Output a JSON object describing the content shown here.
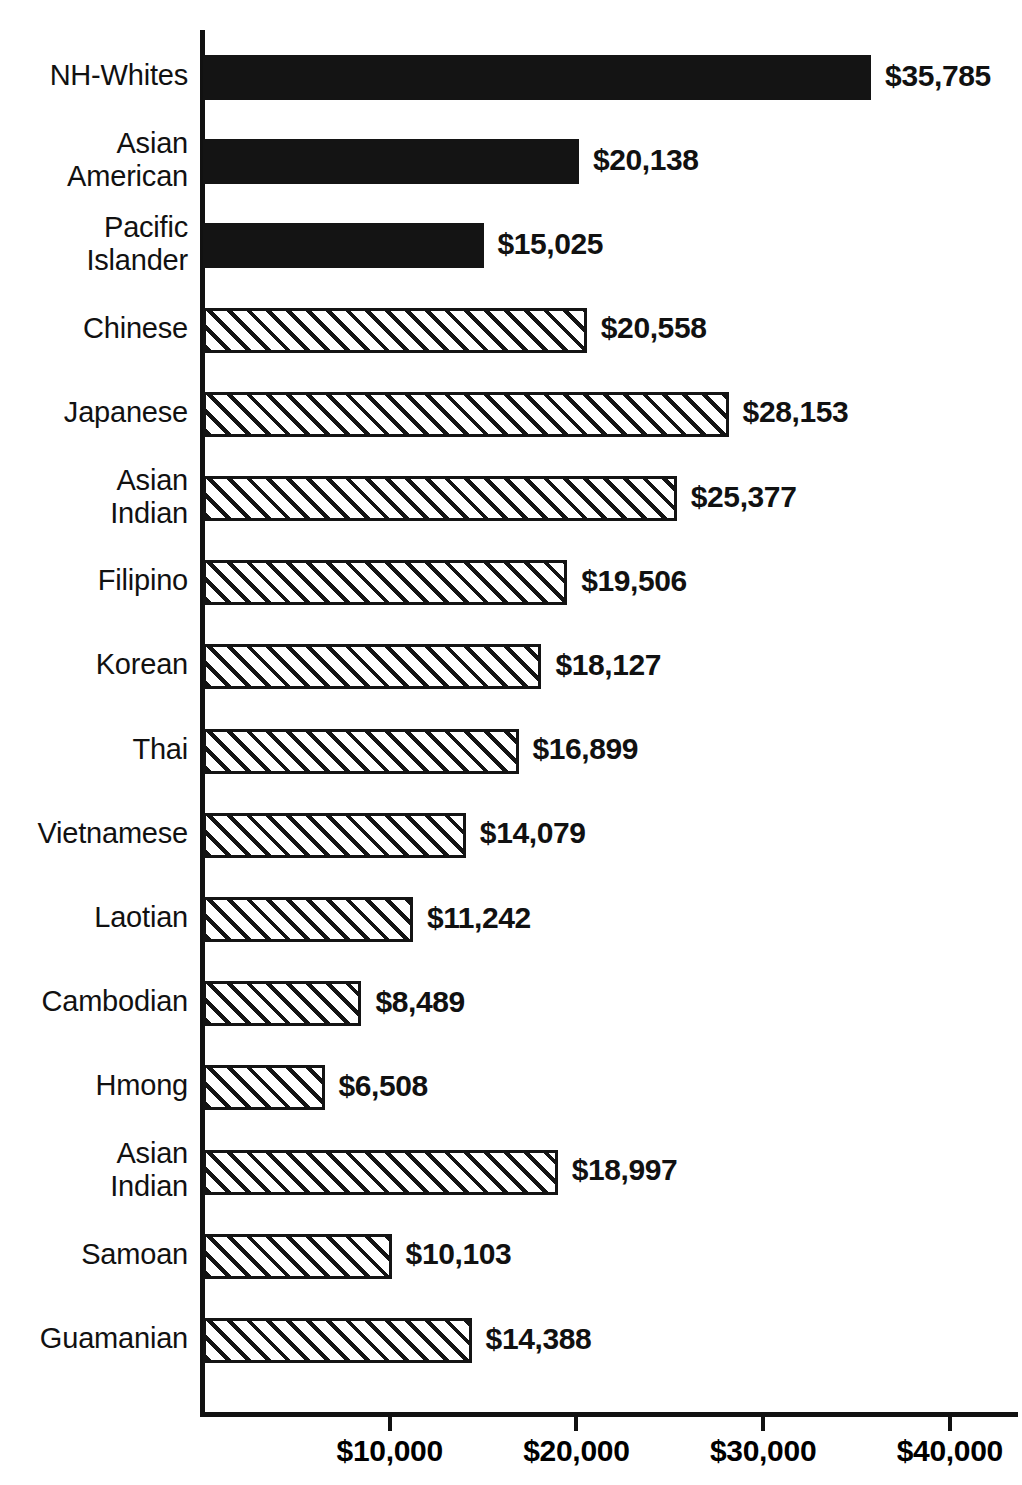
{
  "chart_data": {
    "type": "bar",
    "orientation": "horizontal",
    "title": "",
    "xlabel": "",
    "ylabel": "",
    "xlim": [
      0,
      43800
    ],
    "xticks": [
      10000,
      20000,
      30000,
      40000
    ],
    "xtick_labels": [
      "$10,000",
      "$20,000",
      "$30,000",
      "$40,000"
    ],
    "grid": false,
    "legend": "none",
    "categories": [
      "NH-Whites",
      "Asian\nAmerican",
      "Pacific\nIslander",
      "Chinese",
      "Japanese",
      "Asian\nIndian",
      "Filipino",
      "Korean",
      "Thai",
      "Vietnamese",
      "Laotian",
      "Cambodian",
      "Hmong",
      "Asian\nIndian",
      "Samoan",
      "Guamanian"
    ],
    "values": [
      35785,
      20138,
      15025,
      20558,
      28153,
      25377,
      19506,
      18127,
      16899,
      14079,
      11242,
      8489,
      6508,
      18997,
      10103,
      14388
    ],
    "value_labels": [
      "$35,785",
      "$20,138",
      "$15,025",
      "$20,558",
      "$28,153",
      "$25,377",
      "$19,506",
      "$18,127",
      "$16,899",
      "$14,079",
      "$11,242",
      "$8,489",
      "$6,508",
      "$18,997",
      "$10,103",
      "$14,388"
    ],
    "bar_styles": [
      "solid",
      "solid",
      "solid",
      "hatch",
      "hatch",
      "hatch",
      "hatch",
      "hatch",
      "hatch",
      "hatch",
      "hatch",
      "hatch",
      "hatch",
      "hatch",
      "hatch",
      "hatch"
    ],
    "colors": {
      "solid_fill": "#141414",
      "hatch_line": "#141414",
      "hatch_background": "#ffffff",
      "axis": "#111111",
      "text": "#111111"
    }
  }
}
